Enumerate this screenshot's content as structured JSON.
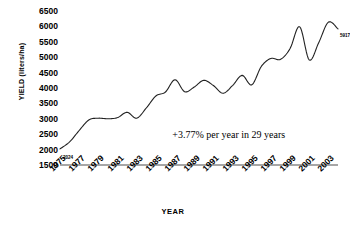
{
  "chart_data": {
    "type": "line",
    "title": "",
    "xlabel": "YEAR",
    "ylabel": "YIELD (liters/ha)",
    "xlim": [
      1975,
      2004
    ],
    "ylim": [
      1500,
      6500
    ],
    "ytick_step": 500,
    "grid": false,
    "legend": null,
    "line_color": "#222222",
    "x": [
      1975,
      1976,
      1977,
      1978,
      1979,
      1980,
      1981,
      1982,
      1983,
      1984,
      1985,
      1986,
      1987,
      1988,
      1989,
      1990,
      1991,
      1992,
      1993,
      1994,
      1995,
      1996,
      1997,
      1998,
      1999,
      2000,
      2001,
      2002,
      2003,
      2004
    ],
    "values": [
      2024,
      2250,
      2620,
      2960,
      3020,
      3000,
      3040,
      3210,
      3020,
      3350,
      3740,
      3870,
      4270,
      3880,
      4030,
      4250,
      4080,
      3830,
      4080,
      4410,
      4100,
      4700,
      4960,
      4930,
      5280,
      5990,
      4910,
      5480,
      6140,
      5917
    ],
    "ytick_labels": [
      "6500",
      "6000",
      "5500",
      "5000",
      "4500",
      "4000",
      "3500",
      "3000",
      "2500",
      "2000",
      "1500"
    ],
    "ytick_values": [
      6500,
      6000,
      5500,
      5000,
      4500,
      4000,
      3500,
      3000,
      2500,
      2000,
      1500
    ],
    "xtick_labels": [
      "1975",
      "1977",
      "1979",
      "1981",
      "1983",
      "1985",
      "1987",
      "1989",
      "1991",
      "1993",
      "1995",
      "1997",
      "1999",
      "2001",
      "2003"
    ],
    "xtick_values": [
      1975,
      1977,
      1979,
      1981,
      1983,
      1985,
      1987,
      1989,
      1991,
      1993,
      1995,
      1997,
      1999,
      2001,
      2003
    ],
    "annotations": [
      {
        "name": "growth-rate-note",
        "text": "+3.77% per year in 29 years",
        "x": 1992.6,
        "y": 2500
      },
      {
        "name": "start-value-label",
        "text": "2024",
        "x": 1975.3,
        "y": 1820
      },
      {
        "name": "end-value-label",
        "text": "5917",
        "x": 2004.2,
        "y": 5790
      }
    ]
  }
}
